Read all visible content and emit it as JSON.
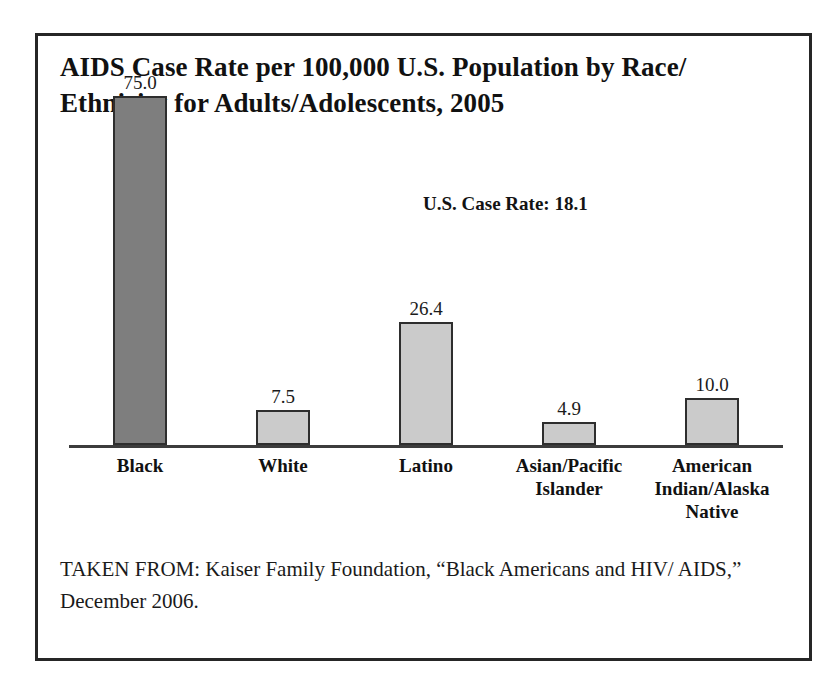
{
  "chart_data": {
    "type": "bar",
    "title_line1": "AIDS Case Rate per 100,000 U.S. Population by Race/",
    "title_line2": "Ethnicity for Adults/Adolescents, 2005",
    "categories": [
      "Black",
      "White",
      "Latino",
      "Asian/Pacific Islander",
      "American Indian/Alaska Native"
    ],
    "values": [
      75.0,
      7.5,
      26.4,
      4.9,
      10.0
    ],
    "value_labels": [
      "75.0",
      "7.5",
      "26.4",
      "4.9",
      "10.0"
    ],
    "bars": [
      {
        "category": "Black",
        "label_lines": [
          "Black"
        ],
        "value": 75.0,
        "value_label": "75.0",
        "color": "#7e7e7e"
      },
      {
        "category": "White",
        "label_lines": [
          "White"
        ],
        "value": 7.5,
        "value_label": "7.5",
        "color": "#cbcbcb"
      },
      {
        "category": "Latino",
        "label_lines": [
          "Latino"
        ],
        "value": 26.4,
        "value_label": "26.4",
        "color": "#cbcbcb"
      },
      {
        "category": "Asian/Pacific Islander",
        "label_lines": [
          "Asian/Pacific",
          "Islander"
        ],
        "value": 4.9,
        "value_label": "4.9",
        "color": "#cbcbcb"
      },
      {
        "category": "American Indian/Alaska Native",
        "label_lines": [
          "American",
          "Indian/Alaska",
          "Native"
        ],
        "value": 10.0,
        "value_label": "10.0",
        "color": "#cbcbcb"
      }
    ],
    "annotation": "U.S. Case Rate: 18.1",
    "xlabel": "",
    "ylabel": "",
    "ylim": [
      0,
      75
    ],
    "grid": false,
    "legend": "none",
    "axis_visible": "baseline-only",
    "bar_outline_color": "#2e2e2e",
    "highlight_color": "#7e7e7e",
    "default_bar_color": "#cbcbcb"
  },
  "source": {
    "text": "TAKEN FROM: Kaiser Family Foundation, “Black Americans and HIV/AIDS,” December 2006.",
    "line1": "TAKEN FROM: Kaiser Family Foundation, “Black Americans and HIV/",
    "line2": "AIDS,” December 2006."
  }
}
